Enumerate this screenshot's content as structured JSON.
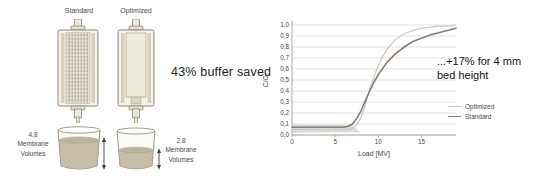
{
  "left_panel": {
    "standard_label": "Standard",
    "optimized_label": "Optimized",
    "standard_volume": {
      "value": "4.8",
      "line2": "Membrane",
      "line3": "Volumes"
    },
    "optimized_volume": {
      "value": "2.8",
      "line2": "Membrane",
      "line3": "Volumes"
    }
  },
  "callout": {
    "buffer_saved": "43% buffer saved"
  },
  "annotation": {
    "line1": "...+17% for 4 mm",
    "line2": "bed height"
  },
  "chart_data": {
    "type": "line",
    "title": "",
    "xlabel": "Load [MV]",
    "ylabel": "C/C₀",
    "xlim": [
      0,
      19
    ],
    "ylim": [
      0,
      1
    ],
    "xticks": [
      0,
      5,
      10,
      15
    ],
    "yticks": [
      {
        "v": 0.0,
        "label": "0,0"
      },
      {
        "v": 0.1,
        "label": "0,1"
      },
      {
        "v": 0.2,
        "label": "0,2"
      },
      {
        "v": 0.3,
        "label": "0,3"
      },
      {
        "v": 0.4,
        "label": "0,4"
      },
      {
        "v": 0.5,
        "label": "0,5"
      },
      {
        "v": 0.6,
        "label": "0,6"
      },
      {
        "v": 0.7,
        "label": "0,7"
      },
      {
        "v": 0.8,
        "label": "0,8"
      },
      {
        "v": 0.9,
        "label": "0,9"
      },
      {
        "v": 1.0,
        "label": "1,0"
      }
    ],
    "grid": "horizontal",
    "legend_position": "right-outside",
    "series": [
      {
        "name": "Optimized",
        "color": "#c8c8c5",
        "stroke_width": 1.2,
        "x": [
          0,
          1,
          2,
          3,
          4,
          5,
          6,
          6.5,
          7,
          7.5,
          8,
          8.5,
          9,
          9.5,
          10,
          10.5,
          11,
          12,
          13,
          14,
          15,
          16,
          17,
          18,
          19
        ],
        "y": [
          0.05,
          0.05,
          0.05,
          0.05,
          0.05,
          0.05,
          0.05,
          0.05,
          0.06,
          0.09,
          0.16,
          0.28,
          0.42,
          0.53,
          0.63,
          0.71,
          0.78,
          0.87,
          0.92,
          0.95,
          0.97,
          0.98,
          0.99,
          0.99,
          1.0
        ]
      },
      {
        "name": "Standard",
        "color": "#8a7c70",
        "stroke_width": 1.6,
        "x": [
          0,
          1,
          2,
          3,
          4,
          5,
          6,
          6.5,
          7,
          7.5,
          8,
          8.5,
          9,
          9.5,
          10,
          11,
          12,
          13,
          14,
          15,
          16,
          17,
          18,
          19
        ],
        "y": [
          0.07,
          0.07,
          0.07,
          0.07,
          0.07,
          0.07,
          0.07,
          0.08,
          0.1,
          0.15,
          0.22,
          0.31,
          0.4,
          0.48,
          0.55,
          0.66,
          0.74,
          0.8,
          0.85,
          0.88,
          0.91,
          0.93,
          0.95,
          0.97
        ]
      }
    ],
    "shaded_region": {
      "color": "#dbdad6",
      "points": [
        [
          0,
          0.02
        ],
        [
          0,
          0.095
        ],
        [
          6.9,
          0.095
        ],
        [
          7.9,
          0.025
        ]
      ]
    }
  }
}
